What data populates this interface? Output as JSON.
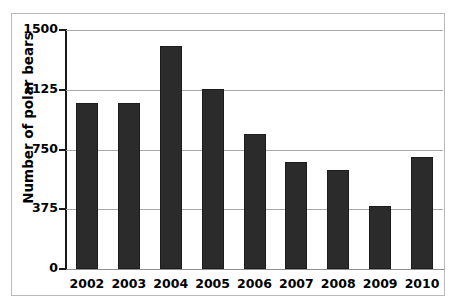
{
  "chart_data": {
    "type": "bar",
    "title": "",
    "subtitle": "",
    "xlabel": "",
    "ylabel": "Number of polar bears",
    "categories": [
      "2002",
      "2003",
      "2004",
      "2005",
      "2006",
      "2007",
      "2008",
      "2009",
      "2010"
    ],
    "values": [
      1040,
      1040,
      1400,
      1130,
      850,
      670,
      620,
      395,
      700
    ],
    "series": [
      {
        "name": "Number of polar bears",
        "values": [
          1040,
          1040,
          1400,
          1130,
          850,
          670,
          620,
          395,
          700
        ]
      }
    ],
    "ylim": [
      0,
      1500
    ],
    "ytick_labels": [
      "0",
      "375",
      "750",
      "1125",
      "1500"
    ],
    "ytick_values": [
      0,
      375,
      750,
      1125,
      1500
    ],
    "xtick_labels": [
      "2002",
      "2003",
      "2004",
      "2005",
      "2006",
      "2007",
      "2008",
      "2009",
      "2010"
    ],
    "grid": true,
    "grid_axis": "y",
    "legend": false,
    "legend_position": "none",
    "bar_color": "#2b2b2b",
    "gridline_color": "#a8a8a8",
    "axis_color": "#1a1a1a",
    "background_color": "#ffffff",
    "frame_color": "#b9b9b9"
  }
}
